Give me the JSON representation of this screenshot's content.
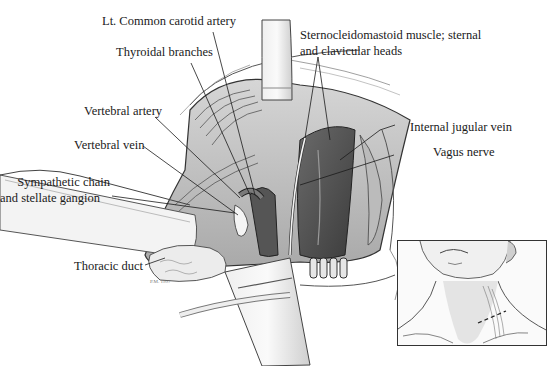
{
  "figure": {
    "type": "surgical-illustration",
    "labels": [
      {
        "id": "lt-common-carotid",
        "text": "Lt. Common carotid artery"
      },
      {
        "id": "thyroidal-branches",
        "text": "Thyroidal branches"
      },
      {
        "id": "scm",
        "text": "Sternocleidomastoid muscle; sternal",
        "text2": "and clavicular heads"
      },
      {
        "id": "vertebral-artery",
        "text": "Vertebral artery"
      },
      {
        "id": "vertebral-vein",
        "text": "Vertebral vein"
      },
      {
        "id": "internal-jugular",
        "text": "Internal jugular vein"
      },
      {
        "id": "vagus",
        "text": "Vagus nerve"
      },
      {
        "id": "sympathetic",
        "text": "Sympathetic chain",
        "text2": "and stellate gangion"
      },
      {
        "id": "thoracic-duct",
        "text": "Thoracic duct"
      }
    ],
    "inset": {
      "description": "Neck view showing dashed incision line above left clavicle"
    },
    "signature": "P.M. 1997"
  }
}
